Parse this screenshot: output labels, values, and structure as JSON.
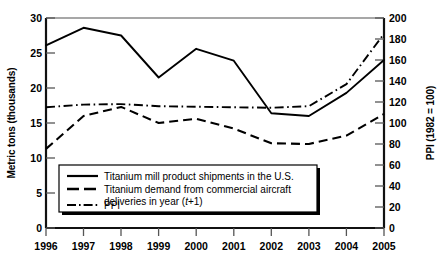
{
  "chart_data": {
    "type": "line",
    "title": "",
    "xlabel": "",
    "ylabel": "Metric tons (thousands)",
    "y2label": "PPI (1982 = 100)",
    "categories": [
      "1996",
      "1997",
      "1998",
      "1999",
      "2000",
      "2001",
      "2002",
      "2003",
      "2004",
      "2005"
    ],
    "x": [
      1996,
      1997,
      1998,
      1999,
      2000,
      2001,
      2002,
      2003,
      2004,
      2005
    ],
    "ylim": [
      0,
      30
    ],
    "y2lim": [
      0,
      200
    ],
    "yticks": [
      0,
      5,
      10,
      15,
      20,
      25,
      30
    ],
    "y2ticks": [
      0,
      20,
      40,
      60,
      80,
      100,
      120,
      140,
      160,
      180,
      200
    ],
    "grid": false,
    "legend_position": "lower-left-inside",
    "series": [
      {
        "name": "Titanium mill product shipments in the U.S.",
        "axis": "left",
        "style": "solid",
        "values": [
          26.1,
          28.6,
          27.5,
          21.5,
          25.6,
          23.9,
          16.4,
          16.0,
          19.3,
          24.0
        ]
      },
      {
        "name": "Titanium demand from commercial aircraft deliveries in year (t+1)",
        "axis": "left",
        "style": "dashed",
        "values": [
          11.3,
          16.0,
          17.3,
          15.0,
          15.6,
          14.2,
          12.1,
          12.0,
          13.2,
          16.3
        ]
      },
      {
        "name": "PPI",
        "axis": "right",
        "style": "dash-dot",
        "values": [
          115.0,
          117.5,
          118.0,
          116.0,
          115.5,
          115.0,
          114.5,
          116.0,
          137.0,
          185.0
        ]
      }
    ]
  },
  "axes": {
    "left_title": "Metric tons (thousands)",
    "right_title": "PPI (1982 = 100)",
    "left_ticks": [
      "0",
      "5",
      "10",
      "15",
      "20",
      "25",
      "30"
    ],
    "right_ticks": [
      "0",
      "20",
      "40",
      "60",
      "80",
      "100",
      "120",
      "140",
      "160",
      "180",
      "200"
    ],
    "x_ticks": [
      "1996",
      "1997",
      "1998",
      "1999",
      "2000",
      "2001",
      "2002",
      "2003",
      "2004",
      "2005"
    ]
  },
  "legend": {
    "entries": [
      {
        "marker": "solid-line",
        "label": "Titanium mill product shipments in the U.S.",
        "label2": ""
      },
      {
        "marker": "dashed-line",
        "label": "Titanium demand from commercial aircraft",
        "label2": "deliveries in year (t+1)"
      },
      {
        "marker": "dash-dot-line",
        "label": "PPI",
        "label2": ""
      }
    ]
  },
  "colors": {
    "line": "#000000",
    "frame": "#1a1a1a",
    "background": "#ffffff"
  }
}
